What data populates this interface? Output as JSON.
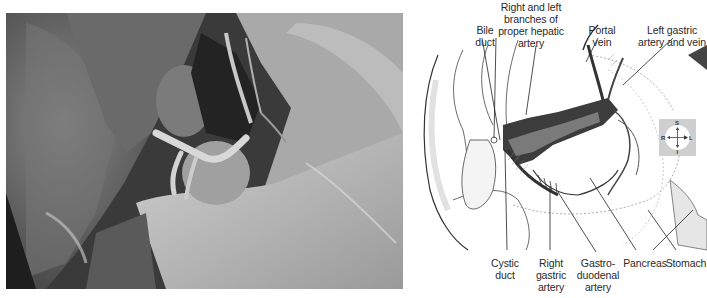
{
  "figure": {
    "photo": {
      "description": "grayscale cadaver dissection photograph of porta hepatis region"
    },
    "diagram": {
      "labels_top": [
        {
          "id": "bile-duct",
          "text": "Bile\nduct"
        },
        {
          "id": "hepatic-artery-branches",
          "text": "Right and left\nbranches of\nproper hepatic\nartery"
        },
        {
          "id": "portal-vein",
          "text": "Portal\nvein"
        },
        {
          "id": "left-gastric",
          "text": "Left gastric\nartery and vein"
        }
      ],
      "labels_bottom": [
        {
          "id": "cystic-duct",
          "text": "Cystic\nduct"
        },
        {
          "id": "right-gastric-artery",
          "text": "Right\ngastric\nartery"
        },
        {
          "id": "gastroduodenal-artery",
          "text": "Gastro-\nduodenal\nartery"
        },
        {
          "id": "pancreas",
          "text": "Pancreas"
        },
        {
          "id": "stomach",
          "text": "Stomach"
        }
      ],
      "compass": {
        "superior": "S",
        "inferior": "I",
        "right": "R",
        "left": "L",
        "background": "#cfcfcf"
      }
    }
  }
}
